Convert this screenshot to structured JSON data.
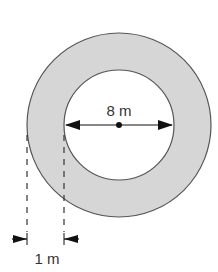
{
  "diagram": {
    "type": "annulus",
    "inner_diameter_label": "8 m",
    "ring_width_label": "1 m",
    "colors": {
      "ring_fill": "#d6d6d6",
      "stroke": "#555555",
      "inner_fill": "#ffffff",
      "arrow": "#111111"
    }
  }
}
